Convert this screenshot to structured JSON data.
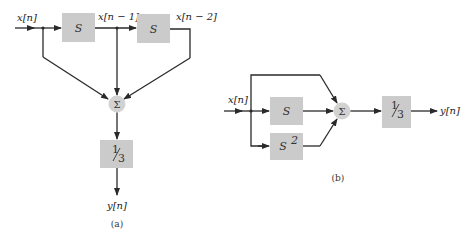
{
  "diagram_a": {
    "caption": "(a)",
    "input_label": "x[n]",
    "tap1_label": "x[n − 1]",
    "tap2_label": "x[n − 2]",
    "block1": "S",
    "block2": "S",
    "summer": "Σ",
    "scale_num": "1",
    "scale_den": "3",
    "output_label": "y[n]"
  },
  "diagram_b": {
    "caption": "(b)",
    "input_label": "x[n]",
    "block_s": "S",
    "block_s2_base": "S",
    "block_s2_exp": "2",
    "summer": "Σ",
    "scale_num": "1",
    "scale_den": "3",
    "output_label": "y[n]"
  },
  "colors": {
    "block_fill": "#cbcbcb",
    "summer_fill": "#d2d2d2",
    "wire": "#2a2a2a"
  }
}
